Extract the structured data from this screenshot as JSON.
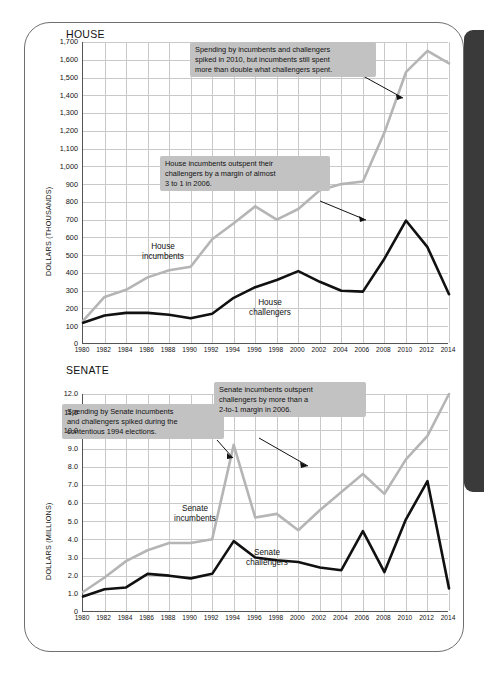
{
  "page": {
    "side_tab_color": "#3a3a3a",
    "incumbent_color": "#b5b5b5",
    "challenger_color": "#111111",
    "callout_bg": "#c2c2c2"
  },
  "house": {
    "title": "HOUSE",
    "ylabel": "DOLLARS (THOUSANDS)",
    "yticks": [
      "0",
      "100",
      "200",
      "300",
      "400",
      "500",
      "600",
      "700",
      "800",
      "900",
      "1,000",
      "1,100",
      "1,200",
      "1,300",
      "1,400",
      "1,500",
      "1,600",
      "1,700"
    ],
    "series_labels": {
      "incumbents": "House\nincumbents",
      "challengers": "House\nchallengers"
    },
    "annotations": [
      {
        "id": "house-anno-2010",
        "text": "Spending by incumbents and challengers\nspiked in 2010, but incumbents still spent\nmore than double what challengers spent."
      },
      {
        "id": "house-anno-2006",
        "text": "House incumbents outspent their\nchallengers by a margin of almost\n3 to 1 in 2006."
      }
    ]
  },
  "senate": {
    "title": "SENATE",
    "ylabel": "DOLLARS (MILLIONS)",
    "yticks": [
      "0",
      "1.0",
      "2.0",
      "3.0",
      "4.0",
      "5.0",
      "6.0",
      "7.0",
      "8.0",
      "9.0",
      "10.0",
      "11.0",
      "12.0"
    ],
    "series_labels": {
      "incumbents": "Senate\nincumbents",
      "challengers": "Senate\nchallengers"
    },
    "annotations": [
      {
        "id": "senate-anno-1994",
        "text": "Spending by Senate incumbents\nand challengers spiked during the\ncontentious 1994 elections."
      },
      {
        "id": "senate-anno-2006",
        "text": "Senate incumbents outspent\nchallengers by more than a\n2-to-1 margin in 2006."
      }
    ]
  },
  "chart_data": [
    {
      "type": "line",
      "id": "house",
      "title": "HOUSE",
      "xlabel": "",
      "ylabel": "DOLLARS (THOUSANDS)",
      "ylim": [
        0,
        1700
      ],
      "ytick_step": 100,
      "grid": true,
      "legend": "inline-labels",
      "x": [
        1980,
        1982,
        1984,
        1986,
        1988,
        1990,
        1992,
        1994,
        1996,
        1998,
        2000,
        2002,
        2004,
        2006,
        2008,
        2010,
        2012,
        2014
      ],
      "xtick_labels": [
        "1980",
        "1982",
        "1984",
        "1986",
        "1988",
        "1990",
        "1992",
        "1994",
        "1996",
        "1998",
        "2000",
        "2002",
        "2004",
        "2006",
        "2008",
        "2010",
        "2012",
        "2014"
      ],
      "series": [
        {
          "name": "House incumbents",
          "color": "#b5b5b5",
          "values": [
            130,
            265,
            305,
            375,
            415,
            435,
            590,
            680,
            775,
            700,
            760,
            865,
            900,
            915,
            1190,
            1530,
            1650,
            1580
          ]
        },
        {
          "name": "House challengers",
          "color": "#111111",
          "values": [
            120,
            160,
            175,
            175,
            165,
            145,
            170,
            260,
            320,
            360,
            410,
            350,
            300,
            295,
            480,
            695,
            545,
            280
          ]
        }
      ]
    },
    {
      "type": "line",
      "id": "senate",
      "title": "SENATE",
      "xlabel": "",
      "ylabel": "DOLLARS (MILLIONS)",
      "ylim": [
        0,
        12.0
      ],
      "ytick_step": 1.0,
      "grid": true,
      "legend": "inline-labels",
      "x": [
        1980,
        1982,
        1984,
        1986,
        1988,
        1990,
        1992,
        1994,
        1996,
        1998,
        2000,
        2002,
        2004,
        2006,
        2008,
        2010,
        2012,
        2014
      ],
      "xtick_labels": [
        "1980",
        "1982",
        "1984",
        "1986",
        "1988",
        "1990",
        "1992",
        "1994",
        "1996",
        "1998",
        "2000",
        "2002",
        "2004",
        "2006",
        "2008",
        "2010",
        "2012",
        "2014"
      ],
      "series": [
        {
          "name": "Senate incumbents",
          "color": "#b5b5b5",
          "values": [
            1.1,
            1.9,
            2.8,
            3.4,
            3.8,
            3.8,
            4.0,
            9.2,
            5.2,
            5.4,
            4.5,
            5.6,
            6.6,
            7.6,
            6.5,
            8.4,
            9.7,
            12.0
          ]
        },
        {
          "name": "Senate challengers",
          "color": "#111111",
          "values": [
            0.85,
            1.25,
            1.35,
            2.1,
            2.0,
            1.85,
            2.1,
            3.9,
            3.0,
            2.85,
            2.75,
            2.45,
            2.3,
            4.45,
            2.2,
            5.1,
            7.2,
            1.3
          ]
        }
      ]
    }
  ]
}
